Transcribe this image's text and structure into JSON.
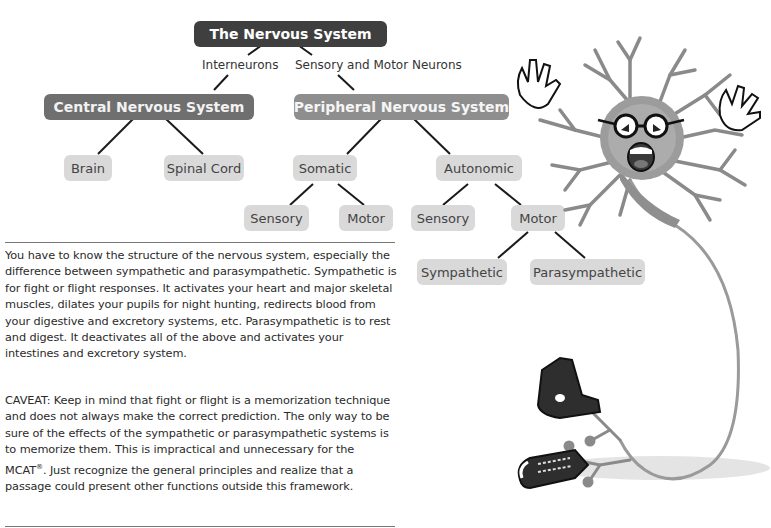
{
  "diagram": {
    "root": "The Nervous System",
    "edge_labels": {
      "left": "Interneurons",
      "right": "Sensory and Motor Neurons"
    },
    "cns": {
      "label": "Central Nervous System",
      "children": [
        "Brain",
        "Spinal Cord"
      ]
    },
    "pns": {
      "label": "Peripheral Nervous System",
      "somatic": {
        "label": "Somatic",
        "children": [
          "Sensory",
          "Motor"
        ]
      },
      "autonomic": {
        "label": "Autonomic",
        "children": [
          "Sensory",
          "Motor"
        ],
        "motor_children": [
          "Sympathetic",
          "Parasympathetic"
        ]
      }
    },
    "colors": {
      "root": "#3f3f3f",
      "level1_cns": "#6f6f6f",
      "level1_pns": "#8e8e8e",
      "leaf": "#d9d9d9",
      "edge": "#1a1a1a"
    }
  },
  "text": {
    "paragraph1": "You have to know the structure of the nervous system, especially the difference between sympathetic and parasympathetic. Sympathetic is for fight or flight responses. It activates your heart and major skeletal muscles, dilates your pupils for night hunting, redirects blood from your digestive and excretory systems, etc. Parasympathetic is to rest and digest. It deactivates all of the above and activates your intestines and excretory system.",
    "paragraph2_before": "CAVEAT: Keep in mind that fight or flight is a memorization technique and does not always make the correct prediction. The only way to be sure of the effects of the sympathetic or parasympathetic systems is to memorize them. This is impractical and unnecessary for the MCAT",
    "paragraph2_reg": "®",
    "paragraph2_after": ". Just recognize the general principles and realize that a passage could present other functions outside this framework."
  },
  "illustration": {
    "subject": "cartoon neuron with glasses and screaming face, hands raised, axon ending in sneakers",
    "icon": "neuron-cartoon-icon"
  }
}
